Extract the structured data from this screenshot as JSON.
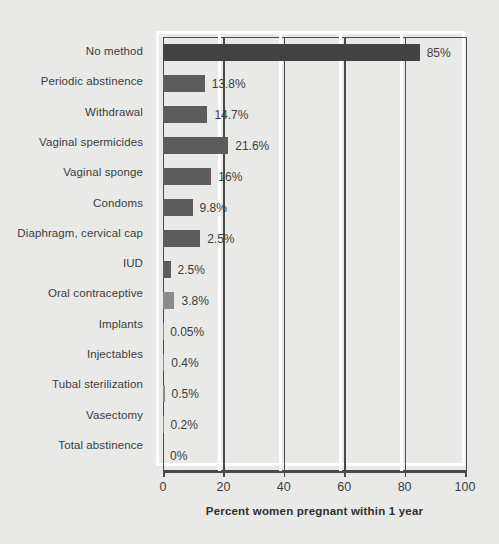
{
  "chart_data": {
    "type": "bar",
    "orientation": "horizontal",
    "title": "",
    "xlabel": "Percent women pregnant within 1 year",
    "ylabel": "",
    "xlim": [
      0,
      100
    ],
    "xticks": [
      0,
      20,
      40,
      60,
      80,
      100
    ],
    "xtick_labels": [
      "0",
      "20",
      "40",
      "60",
      "80",
      "100"
    ],
    "grid": "vertical gridlines at 20, 40, 60, 80",
    "legend": "none",
    "categories": [
      "No method",
      "Periodic abstinence",
      "Withdrawal",
      "Vaginal spermicides",
      "Vaginal sponge",
      "Condoms",
      "Diaphragm, cervical cap",
      "IUD",
      "Oral contraceptive",
      "Implants",
      "Injectables",
      "Tubal sterilization",
      "Vasectomy",
      "Total abstinence"
    ],
    "values": [
      85,
      13.8,
      14.7,
      21.6,
      16,
      9.8,
      2.5,
      2.5,
      3.8,
      0.05,
      0.4,
      0.5,
      0.2,
      0
    ],
    "data_labels": [
      "85%",
      "13.8%",
      "14.7%",
      "21.6%",
      "16%",
      "9.8%",
      "2.5%",
      "2.5%",
      "3.8%",
      "0.05%",
      "0.4%",
      "0.5%",
      "0.2%",
      "0%"
    ],
    "bar_lengths_pct": [
      85,
      13.8,
      14.7,
      21.6,
      16,
      9.8,
      12.3,
      2.5,
      3.8,
      0.05,
      0.4,
      0.5,
      0.2,
      0
    ],
    "bar_shades": [
      "dark",
      "mid",
      "mid",
      "mid",
      "mid",
      "mid",
      "mid",
      "mid",
      "light",
      "light",
      "light",
      "light",
      "light",
      "light"
    ]
  },
  "colors": {
    "background": "#e9e9e8",
    "bar_dark": "#424242",
    "bar_mid": "#5c5c5c",
    "bar_light": "#8b8b8b",
    "axis": "#4a4a4a",
    "gridline": "#ffffff",
    "text": "#3d3d3d"
  }
}
